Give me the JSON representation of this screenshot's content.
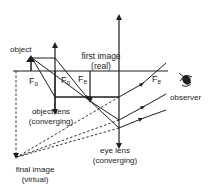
{
  "diagram": {
    "type": "compound-microscope-ray-diagram",
    "colors": {
      "line": "#1e1e1e",
      "background": "#ffffff"
    },
    "labels": {
      "object": "object",
      "first_image_line1": "first image",
      "first_image_line2": "(real)",
      "fo_left": "F",
      "fo_left_sub": "o",
      "fo_right": "F",
      "fo_right_sub": "o",
      "fe_left": "F",
      "fe_left_sub": "e",
      "fe_right": "F",
      "fe_right_sub": "e",
      "observer": "observer",
      "object_lens_line1": "object lens",
      "object_lens_line2": "(converging)",
      "eye_lens_line1": "eye lens",
      "eye_lens_line2": "(converging)",
      "final_image_line1": "final image",
      "final_image_line2": "(virtual)"
    },
    "icons": [
      "eye-icon"
    ]
  }
}
